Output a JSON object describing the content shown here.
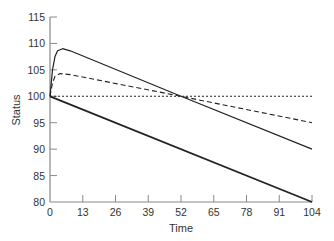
{
  "chart_data": {
    "type": "line",
    "title": "",
    "xlabel": "Time",
    "ylabel": "Status",
    "xlim": [
      0,
      104
    ],
    "ylim": [
      80,
      115
    ],
    "x_ticks": [
      0,
      13,
      26,
      39,
      52,
      65,
      78,
      91,
      104
    ],
    "y_ticks": [
      80,
      85,
      90,
      95,
      100,
      105,
      110,
      115
    ],
    "grid": false,
    "legend": null,
    "series": [
      {
        "name": "solid-upper",
        "style": "solid",
        "width": 1.2,
        "x": [
          0,
          1,
          2,
          3,
          5,
          8,
          52,
          104
        ],
        "y": [
          100,
          105,
          107.5,
          108.6,
          109,
          108.6,
          100,
          90
        ]
      },
      {
        "name": "dashed",
        "style": "dashed",
        "width": 1.1,
        "x": [
          0,
          1,
          2,
          4,
          8,
          52,
          104
        ],
        "y": [
          100,
          102.5,
          103.8,
          104.3,
          104.1,
          100,
          95
        ]
      },
      {
        "name": "dotted-baseline",
        "style": "dotted",
        "width": 1.1,
        "x": [
          0,
          104
        ],
        "y": [
          100,
          100
        ]
      },
      {
        "name": "solid-lower",
        "style": "solid",
        "width": 1.8,
        "x": [
          0,
          104
        ],
        "y": [
          100,
          80
        ]
      }
    ]
  }
}
